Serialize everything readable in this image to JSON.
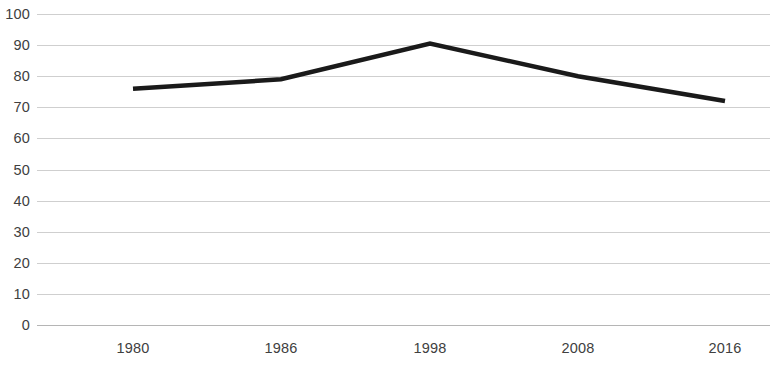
{
  "chart_data": {
    "type": "line",
    "title": "",
    "subtitle": "",
    "xlabel": "",
    "ylabel": "",
    "categories": [
      "1980",
      "1986",
      "1998",
      "2008",
      "2016"
    ],
    "x": [
      1980,
      1986,
      1998,
      2008,
      2016
    ],
    "values": [
      76,
      79,
      90.5,
      80,
      72
    ],
    "series": [
      {
        "name": "",
        "values": [
          76,
          79,
          90.5,
          80,
          72
        ]
      }
    ],
    "ylim": [
      0,
      100
    ],
    "y_ticks": [
      0,
      10,
      20,
      30,
      40,
      50,
      60,
      70,
      80,
      90,
      100
    ],
    "y_tick_labels": [
      "0",
      "10",
      "20",
      "30",
      "40",
      "50",
      "60",
      "70",
      "80",
      "90",
      "100"
    ],
    "x_tick_labels": [
      "1980",
      "1986",
      "1998",
      "2008",
      "2016"
    ],
    "grid": "horizontal",
    "legend": "none",
    "line_color": "#1a1a1a",
    "line_width": 4.5,
    "gridline_color": "#cfcfcf",
    "axis_color": "#b5b5b5",
    "tick_label_color": "#404040",
    "background_color": "#ffffff",
    "annotations": []
  },
  "axes": {
    "y": {
      "ticks": [
        {
          "label": "100",
          "value": 100
        },
        {
          "label": "90",
          "value": 90
        },
        {
          "label": "80",
          "value": 80
        },
        {
          "label": "70",
          "value": 70
        },
        {
          "label": "60",
          "value": 60
        },
        {
          "label": "50",
          "value": 50
        },
        {
          "label": "40",
          "value": 40
        },
        {
          "label": "30",
          "value": 30
        },
        {
          "label": "20",
          "value": 20
        },
        {
          "label": "10",
          "value": 10
        },
        {
          "label": "0",
          "value": 0
        }
      ]
    },
    "x": {
      "ticks": [
        {
          "label": "1980",
          "value": 1980
        },
        {
          "label": "1986",
          "value": 1986
        },
        {
          "label": "1998",
          "value": 1998
        },
        {
          "label": "2008",
          "value": 2008
        },
        {
          "label": "2016",
          "value": 2016
        }
      ]
    }
  }
}
